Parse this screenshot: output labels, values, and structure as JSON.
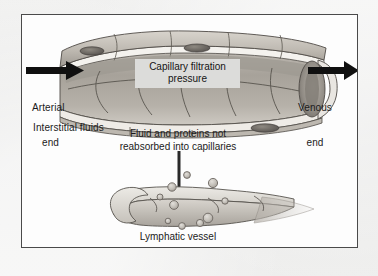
{
  "figure": {
    "title_text_present": false,
    "page_background": "#ececeb",
    "panel_background": "#fdfdfd",
    "panel_border_color": "#4a4a4a"
  },
  "labels": {
    "arterial_end": "Arterial\nend",
    "arterial_end_line1": "Arterial",
    "arterial_end_line2": "end",
    "venous_end_line1": "Venous",
    "venous_end_line2": "end",
    "interstitial_fluids": "Interstitial fluids",
    "capillary_filtration_pressure_line1": "Capillary filtration",
    "capillary_filtration_pressure_line2": "pressure",
    "fluid_caption_line1": "Fluid and proteins not",
    "fluid_caption_line2": "reabsorbed into capillaries",
    "lymphatic_vessel": "Lymphatic vessel"
  },
  "colors": {
    "arrow_black": "#101010",
    "label_box_fill": "#dcdcda",
    "text": "#1b1b1b",
    "capillary_cell_light": "#cfcbc4",
    "capillary_cell_mid": "#b3aea6",
    "capillary_cell_dark": "#8d8881",
    "capillary_outline": "#4f4b46",
    "lumen_shadow": "#9a958d",
    "vessel_fill": "#cac6bf",
    "vessel_outline": "#57534e",
    "particle_fill": "#c7c3bc",
    "particle_outline": "#6d6862"
  },
  "diagram": {
    "type": "biological-illustration",
    "flow_direction_left": "into capillary at arterial end",
    "flow_direction_right": "out of capillary at venous end",
    "downward_flow": "fluid and proteins move from interstitium into lymphatic vessel"
  },
  "particles": [
    {
      "cx": 150,
      "cy": 172,
      "r": 4.2
    },
    {
      "cx": 165,
      "cy": 160,
      "r": 3.4
    },
    {
      "cx": 138,
      "cy": 182,
      "r": 3.0
    },
    {
      "cx": 152,
      "cy": 190,
      "r": 4.4
    },
    {
      "cx": 191,
      "cy": 168,
      "r": 4.6
    },
    {
      "cx": 203,
      "cy": 186,
      "r": 3.2
    },
    {
      "cx": 186,
      "cy": 203,
      "r": 4.8
    },
    {
      "cx": 160,
      "cy": 211,
      "r": 3.4
    },
    {
      "cx": 178,
      "cy": 208,
      "r": 3.6
    },
    {
      "cx": 146,
      "cy": 206,
      "r": 2.8
    }
  ]
}
